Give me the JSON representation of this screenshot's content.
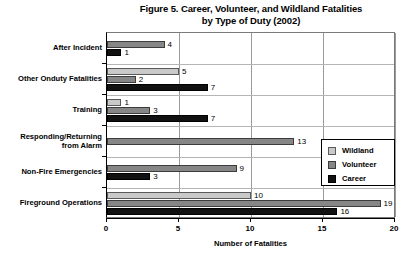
{
  "chart_data": {
    "type": "bar",
    "orientation": "horizontal",
    "title": "Figure 5. Career, Volunteer, and Wildland Fatalities by Type of Duty (2002)",
    "title_line1": "Figure 5. Career, Volunteer, and Wildland Fatalities",
    "title_line2": "by Type of Duty (2002)",
    "xlabel": "Number of Fatalities",
    "ylabel": "",
    "xlim": [
      0,
      20
    ],
    "xticks": [
      0,
      5,
      10,
      15,
      20
    ],
    "xtick_labels": [
      "0",
      "5",
      "10",
      "15",
      "20"
    ],
    "grid": true,
    "legend_position": "inside-right",
    "categories": [
      "After Incident",
      "Other Onduty Fatalities",
      "Training",
      "Responding/Returning from Alarm",
      "Non-Fire Emergencies",
      "Fireground Operations"
    ],
    "category_label_lines": [
      [
        "After Incident"
      ],
      [
        "Other Onduty Fatalities"
      ],
      [
        "Training"
      ],
      [
        "Responding/Returning",
        "from Alarm"
      ],
      [
        "Non-Fire Emergencies"
      ],
      [
        "Fireground Operations"
      ]
    ],
    "series": [
      {
        "name": "Wildland",
        "color": "#c9c9c9",
        "values": [
          null,
          5,
          1,
          null,
          null,
          10
        ],
        "value_labels": [
          "",
          "5",
          "1",
          "",
          "",
          "10"
        ]
      },
      {
        "name": "Volunteer",
        "color": "#868686",
        "values": [
          4,
          2,
          3,
          13,
          9,
          19
        ],
        "value_labels": [
          "4",
          "2",
          "3",
          "13",
          "9",
          "19"
        ]
      },
      {
        "name": "Career",
        "color": "#111111",
        "values": [
          1,
          7,
          7,
          null,
          3,
          16
        ],
        "value_labels": [
          "1",
          "7",
          "7",
          "",
          "3",
          "16"
        ]
      }
    ]
  },
  "legend": {
    "items": [
      {
        "label": "Wildland",
        "swatch": "wildland"
      },
      {
        "label": "Volunteer",
        "swatch": "volunteer"
      },
      {
        "label": "Career",
        "swatch": "career"
      }
    ]
  }
}
